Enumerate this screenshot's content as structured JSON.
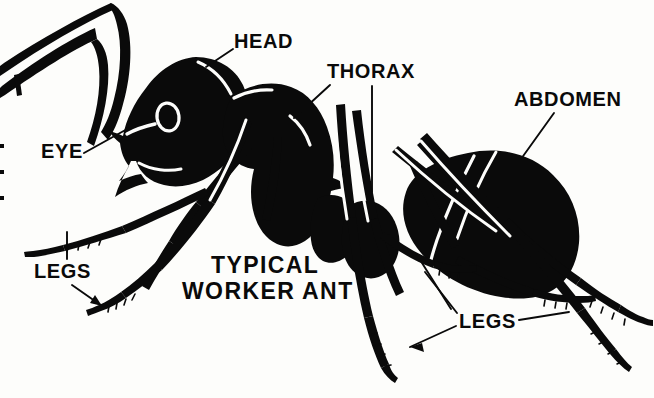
{
  "figure": {
    "kind": "anatomical-diagram",
    "subject": "ant",
    "style": "black-and-white silhouette line art",
    "background_color": "#fdfdfb",
    "ink_color": "#0a0a0a",
    "width": 654,
    "height": 398
  },
  "title": {
    "line1": "TYPICAL",
    "line2": "WORKER ANT"
  },
  "labels": {
    "head": "HEAD",
    "thorax": "THORAX",
    "abdomen": "ABDOMEN",
    "eye": "EYE",
    "legs_left": "LEGS",
    "legs_right": "LEGS"
  },
  "leader_lines": {
    "head": {
      "from": [
        233,
        48
      ],
      "to": [
        207,
        66
      ]
    },
    "thorax": {
      "from": [
        330,
        84
      ],
      "to": [
        296,
        116
      ]
    },
    "thorax2": {
      "from": [
        372,
        84
      ],
      "to": [
        372,
        190
      ]
    },
    "abdomen": {
      "from": [
        554,
        112
      ],
      "to": [
        521,
        158
      ]
    },
    "eye": {
      "from": [
        83,
        152
      ],
      "to": [
        127,
        128
      ]
    },
    "legs_left_up": {
      "from": [
        67,
        258
      ],
      "to": [
        67,
        233
      ]
    },
    "legs_left_down": {
      "from": [
        70,
        284
      ],
      "to": [
        100,
        305
      ]
    },
    "legs_right_up1": {
      "from": [
        457,
        314
      ],
      "to": [
        424,
        273
      ]
    },
    "legs_right_up2": {
      "from": [
        452,
        310
      ],
      "to": [
        417,
        254
      ]
    },
    "legs_right_out": {
      "from": [
        519,
        320
      ],
      "to": [
        567,
        312
      ]
    },
    "legs_right_dn": {
      "from": [
        455,
        325
      ],
      "to": [
        412,
        345
      ]
    }
  }
}
